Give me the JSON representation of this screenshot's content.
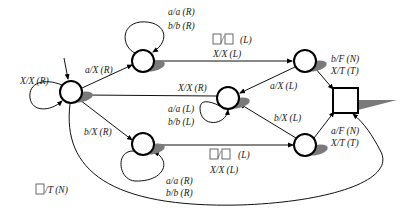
{
  "diagram": {
    "type": "turing-machine-state-diagram",
    "states": [
      {
        "id": "q0",
        "role": "start",
        "shape": "circle"
      },
      {
        "id": "q1",
        "role": "normal",
        "shape": "circle"
      },
      {
        "id": "q2",
        "role": "normal",
        "shape": "circle"
      },
      {
        "id": "q3",
        "role": "normal",
        "shape": "circle"
      },
      {
        "id": "q4",
        "role": "normal",
        "shape": "circle"
      },
      {
        "id": "q5",
        "role": "normal",
        "shape": "circle"
      },
      {
        "id": "qf",
        "role": "final",
        "shape": "square"
      }
    ],
    "labels": {
      "q0_loop": "X/X (R)",
      "q0_q1": "a/X (R)",
      "q1_loop_1": "a/a (R)",
      "q1_loop_2": "b/b (R)",
      "q1_q2_blank": "(L)",
      "q1_q2_2": "X/X (L)",
      "q2_q3": "a/X (L)",
      "q2_qf_1": "b/F (N)",
      "q2_qf_2": "X/T (T)",
      "q3_q0": "X/X (R)",
      "q3_loop_1": "a/a (L)",
      "q3_loop_2": "b/b (L)",
      "q0_q4": "b/X (R)",
      "q4_loop_1": "a/a (R)",
      "q4_loop_2": "b/b (R)",
      "q4_q5_blank": "(L)",
      "q4_q5_2": "X/X (L)",
      "q5_q3": "b/X (L)",
      "q5_qf_1": "a/F (N)",
      "q5_qf_2": "X/T (T)",
      "q0_qf": "/T (N)"
    },
    "blank_symbol": "□"
  }
}
